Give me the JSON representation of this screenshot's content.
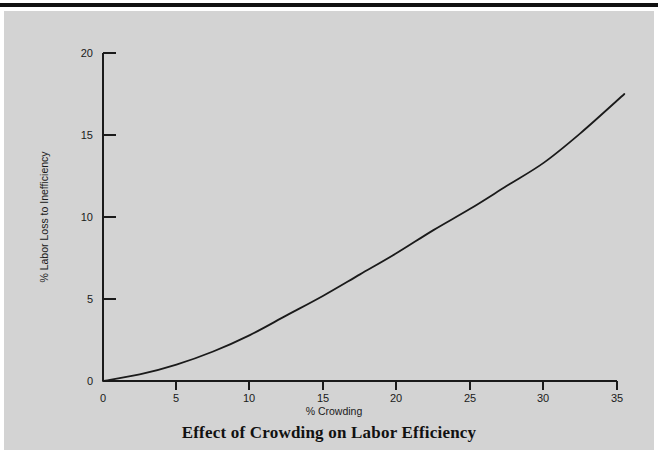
{
  "figure": {
    "background_color": "#d3d3d3",
    "page_background": "#ffffff",
    "rule_color": "#111111",
    "line_color": "#1a1a1a"
  },
  "chart_data": {
    "type": "line",
    "title": "Effect of Crowding on Labor Efficiency",
    "xlabel": "% Crowding",
    "ylabel": "% Labor Loss to Inefficiency",
    "xlim": [
      0,
      35
    ],
    "ylim": [
      0,
      20
    ],
    "grid": false,
    "legend": null,
    "xticks": [
      0,
      5,
      10,
      15,
      20,
      25,
      30,
      35
    ],
    "xtick_labels": [
      "0",
      "5",
      "10",
      "15",
      "20",
      "25",
      "30",
      "35"
    ],
    "yticks": [
      0,
      5,
      10,
      15,
      20
    ],
    "ytick_labels": [
      "0",
      "5",
      "10",
      "15",
      "20"
    ],
    "series": [
      {
        "name": "Labor loss to inefficiency",
        "x": [
          0,
          2.5,
          5,
          7.5,
          10,
          12.5,
          15,
          17.5,
          20,
          22.5,
          25,
          27.5,
          30,
          32.5,
          35.5
        ],
        "values": [
          0.0,
          0.4,
          1.0,
          1.8,
          2.8,
          4.0,
          5.2,
          6.5,
          7.8,
          9.2,
          10.5,
          11.9,
          13.3,
          15.1,
          17.5
        ]
      }
    ]
  }
}
